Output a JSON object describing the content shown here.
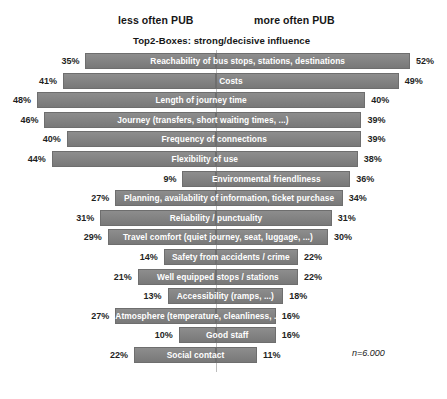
{
  "header": {
    "left_label": "less often PUB",
    "right_label": "more often PUB",
    "subtitle": "Top2-Boxes: strong/decisive influence",
    "note": "n=6.000"
  },
  "style": {
    "bar_color": "#808080",
    "bar_border": "#6e6e6e",
    "bar_label_color": "#ffffff",
    "axis_color": "#bdbdbd",
    "background": "#ffffff"
  },
  "chart_data": {
    "type": "bar",
    "subtype": "diverging-horizontal-bar",
    "title": "Top2-Boxes: strong/decisive influence",
    "subtitle": "",
    "xlabel": "",
    "ylabel": "",
    "legend_position": "top",
    "grid": false,
    "axis": {
      "center_value": 0,
      "left_series_name": "less often PUB",
      "right_series_name": "more often PUB",
      "unit": "%",
      "left_max": 48,
      "right_max": 52
    },
    "categories": [
      "Reachability of bus stops, stations, destinations",
      "Costs",
      "Length of journey time",
      "Journey (transfers, short waiting times, ...)",
      "Frequency of connections",
      "Flexibility of use",
      "Environmental friendliness",
      "Planning, availability of information, ticket purchase",
      "Reliability / punctuality",
      "Travel comfort (quiet journey, seat, luggage, ...)",
      "Safety from accidents / crime",
      "Well equipped stops / stations",
      "Accessibility (ramps, ...)",
      "Atmosphere (temperature, cleanliness, ...)",
      "Good staff",
      "Social contact"
    ],
    "series": [
      {
        "name": "less often PUB",
        "side": "left",
        "values": [
          35,
          41,
          48,
          46,
          40,
          44,
          9,
          27,
          31,
          29,
          14,
          21,
          13,
          27,
          10,
          22
        ],
        "labels": [
          "35%",
          "41%",
          "48%",
          "46%",
          "40%",
          "44%",
          "9%",
          "27%",
          "31%",
          "29%",
          "14%",
          "21%",
          "13%",
          "27%",
          "10%",
          "22%"
        ]
      },
      {
        "name": "more often PUB",
        "side": "right",
        "values": [
          52,
          49,
          40,
          39,
          39,
          38,
          36,
          34,
          31,
          30,
          22,
          22,
          18,
          16,
          16,
          11
        ],
        "labels": [
          "52%",
          "49%",
          "40%",
          "39%",
          "39%",
          "38%",
          "36%",
          "34%",
          "31%",
          "30%",
          "22%",
          "22%",
          "18%",
          "16%",
          "16%",
          "11%"
        ]
      }
    ],
    "annotations": [
      {
        "text": "n=6.000",
        "position": "bottom-right"
      }
    ]
  }
}
